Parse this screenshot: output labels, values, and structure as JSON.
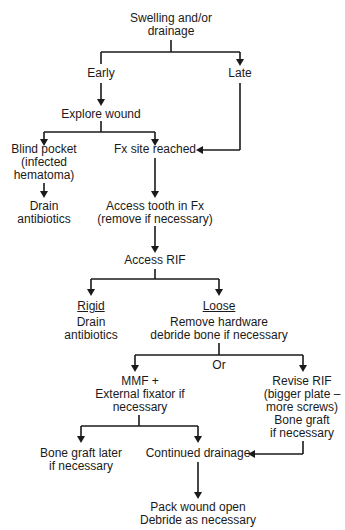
{
  "nodes": {
    "start": [
      "Swelling and/or",
      "drainage"
    ],
    "early": [
      "Early"
    ],
    "late": [
      "Late"
    ],
    "explore": [
      "Explore wound"
    ],
    "blind": [
      "Blind pocket",
      "(infected",
      "hematoma)"
    ],
    "fx_site": [
      "Fx site reached"
    ],
    "drain1": [
      "Drain",
      "antibiotics"
    ],
    "access_tooth": [
      "Access tooth in Fx",
      "(remove if necessary)"
    ],
    "access_rif": [
      "Access RIF"
    ],
    "rigid_label": "Rigid",
    "rigid": [
      "Drain",
      "antibiotics"
    ],
    "loose_label": "Loose",
    "loose": [
      "Remove hardware",
      "debride bone if necessary"
    ],
    "or": [
      "Or"
    ],
    "mmf": [
      "MMF +",
      "External fixator if",
      "necessary"
    ],
    "revise": [
      "Revise RIF",
      "(bigger plate –",
      "more screws)",
      "Bone graft",
      "if necessary"
    ],
    "bone_graft": [
      "Bone graft later",
      "if necessary"
    ],
    "continued": [
      "Continued drainage"
    ],
    "pack": [
      "Pack wound open",
      "Debride as necessary"
    ]
  },
  "colors": {
    "line": "#1a1a1a",
    "text": "#1a1a1a",
    "background": "#ffffff"
  }
}
